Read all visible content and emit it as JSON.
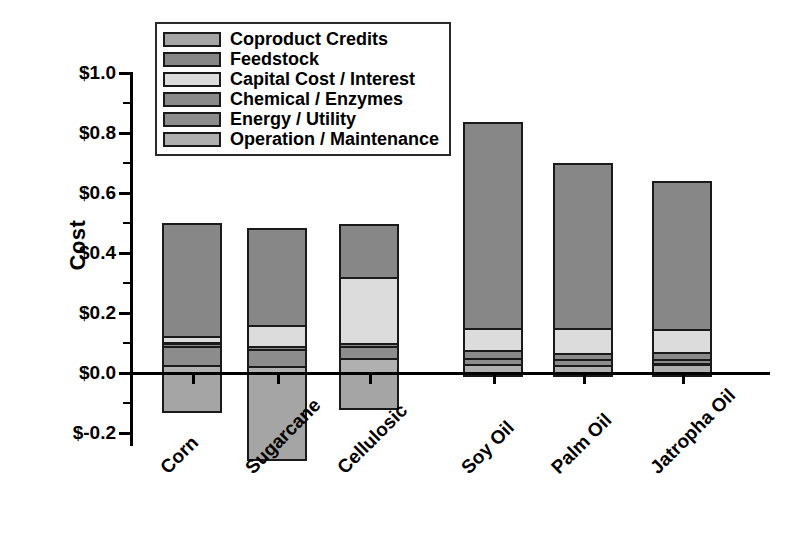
{
  "chart_data": {
    "type": "bar",
    "subtype": "stacked-bar-with-negative",
    "title": "",
    "xlabel": "",
    "ylabel": "Cost",
    "ylim": [
      -0.32,
      1.06
    ],
    "ytick_labels": [
      "$1.0",
      "$0.8",
      "$0.6",
      "$0.4",
      "$0.2",
      "$0.0",
      "$-0.2"
    ],
    "ytick_values": [
      1.0,
      0.8,
      0.6,
      0.4,
      0.2,
      0.0,
      -0.2
    ],
    "minor_tick_interval": 0.1,
    "grid": false,
    "legend_position": "top-left",
    "categories": [
      "Corn",
      "Sugarcane",
      "Cellulosic",
      "Soy Oil",
      "Palm Oil",
      "Jatropha Oil"
    ],
    "series": [
      {
        "name": "Operation / Maintenance",
        "color": "#b0b0b0",
        "values": [
          0.025,
          0.022,
          0.048,
          0.028,
          0.026,
          0.03
        ]
      },
      {
        "name": "Energy / Utility",
        "color": "#8c8c8c",
        "values": [
          0.062,
          0.055,
          0.04,
          0.02,
          0.018,
          0.016
        ]
      },
      {
        "name": "Chemical / Enzymes",
        "color": "#8a8a8a",
        "values": [
          0.013,
          0.012,
          0.012,
          0.026,
          0.022,
          0.022
        ]
      },
      {
        "name": "Capital Cost / Interest",
        "color": "#dcdcdc",
        "values": [
          0.022,
          0.068,
          0.22,
          0.075,
          0.082,
          0.078
        ]
      },
      {
        "name": "Feedstock",
        "color": "#878787",
        "values": [
          0.378,
          0.325,
          0.175,
          0.686,
          0.552,
          0.494
        ]
      },
      {
        "name": "Coproduct Credits",
        "color": "#a5a5a5",
        "values": [
          -0.135,
          -0.295,
          -0.125,
          -0.015,
          -0.014,
          -0.014
        ]
      }
    ],
    "totals": [
      0.5,
      0.482,
      0.695,
      0.835,
      0.7,
      0.64
    ],
    "annotations": []
  },
  "legend": {
    "items": [
      {
        "label": "Coproduct Credits",
        "color": "#a5a5a5"
      },
      {
        "label": "Feedstock",
        "color": "#878787"
      },
      {
        "label": "Capital Cost / Interest",
        "color": "#dcdcdc"
      },
      {
        "label": "Chemical / Enzymes",
        "color": "#8a8a8a"
      },
      {
        "label": "Energy / Utility",
        "color": "#8c8c8c"
      },
      {
        "label": "Operation / Maintenance",
        "color": "#b0b0b0"
      }
    ]
  }
}
